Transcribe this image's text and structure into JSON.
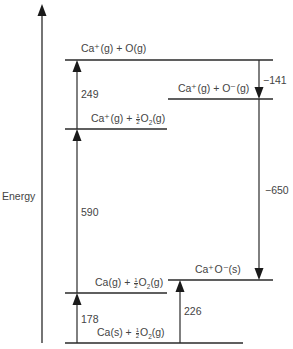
{
  "diagram": {
    "type": "energy-level (Born-Haber cycle)",
    "axis_label": "Energy",
    "levels": [
      {
        "id": "ca_plus_o",
        "label": "Ca⁺(g) + O(g)"
      },
      {
        "id": "ca_plus_o_minus",
        "label": "Ca⁺(g) + O⁻(g)"
      },
      {
        "id": "ca_plus_half_o2",
        "label_prefix": "Ca⁺(g) + ",
        "label_frac_num": "1",
        "label_frac_den": "2",
        "label_species": "O",
        "label_sub": "2",
        "label_suffix": "(g)"
      },
      {
        "id": "ca_g_half_o2",
        "label_prefix": "Ca(g) + ",
        "label_frac_num": "1",
        "label_frac_den": "2",
        "label_species": "O",
        "label_sub": "2",
        "label_suffix": "(g)"
      },
      {
        "id": "caO_solid",
        "label": "Ca⁺O⁻(s)"
      },
      {
        "id": "ca_s_half_o2",
        "label_prefix": "Ca(s) + ",
        "label_frac_num": "1",
        "label_frac_den": "2",
        "label_species": "O",
        "label_sub": "2",
        "label_suffix": "(g)"
      }
    ],
    "steps": [
      {
        "from": "ca_s_half_o2",
        "to": "ca_g_half_o2",
        "value": "178",
        "direction": "up"
      },
      {
        "from": "ca_g_half_o2",
        "to": "ca_plus_half_o2",
        "value": "590",
        "direction": "up"
      },
      {
        "from": "ca_plus_half_o2",
        "to": "ca_plus_o",
        "value": "249",
        "direction": "up"
      },
      {
        "from": "ca_plus_o",
        "to": "ca_plus_o_minus",
        "value": "−141",
        "direction": "down"
      },
      {
        "from": "ca_plus_o_minus",
        "to": "caO_solid",
        "value": "−650",
        "direction": "down"
      },
      {
        "from": "ca_s_half_o2",
        "to": "caO_solid",
        "value": "226",
        "direction": "up"
      }
    ]
  }
}
